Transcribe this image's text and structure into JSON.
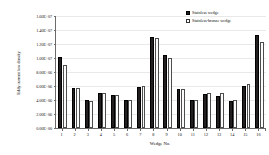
{
  "chart_data": {
    "type": "bar",
    "title": "",
    "xlabel": "Wedge No.",
    "ylabel": "Eddy current loss density",
    "categories": [
      "1",
      "2",
      "3",
      "4",
      "5",
      "6",
      "7",
      "8",
      "9",
      "10",
      "11",
      "12",
      "13",
      "14",
      "15",
      "16"
    ],
    "series": [
      {
        "name": "Stainless wedge",
        "color": "#231f20",
        "values": [
          10100000,
          5650000,
          3950000,
          5050000,
          4750000,
          3950000,
          5900000,
          13000000,
          10500000,
          5550000,
          4000000,
          4900000,
          4550000,
          3900000,
          6050000,
          13300000
        ]
      },
      {
        "name": "Stainless-bronze wedge",
        "color": "#ffffff",
        "values": [
          9000000,
          5700000,
          3850000,
          4950000,
          4700000,
          3950000,
          5950000,
          12800000,
          10050000,
          5600000,
          3950000,
          4950000,
          4950000,
          4050000,
          6250000,
          12300000
        ]
      }
    ],
    "ylim": [
      0,
      16000000
    ],
    "ytick_values": [
      0,
      2000000,
      4000000,
      6000000,
      8000000,
      10000000,
      12000000,
      14000000,
      16000000
    ],
    "ytick_labels": [
      "0.00E+00",
      "2.00E+06",
      "4.00E+06",
      "6.00E+06",
      "8.00E+06",
      "1.00E+07",
      "1.20E+07",
      "1.40E+07",
      "1.60E+07"
    ],
    "grid": true,
    "legend_position": "top-right"
  },
  "legend": {
    "items": [
      {
        "label": "Stainless wedge",
        "marker": "filled-square-marker"
      },
      {
        "label": "Stainless-bronze wedge",
        "marker": "empty-square-marker"
      }
    ]
  },
  "axes": {
    "x_title": "Wedge No.",
    "y_title": "Eddy current loss density"
  }
}
